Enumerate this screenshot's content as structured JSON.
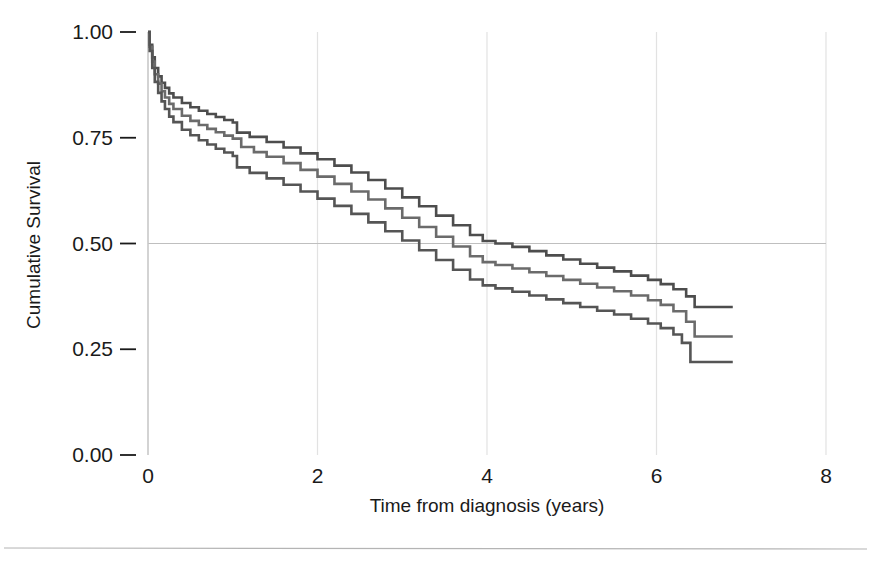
{
  "chart_data": {
    "type": "line",
    "title": "",
    "subtitle": "",
    "xlabel": "Time from diagnosis (years)",
    "ylabel": "Cumulative Survival",
    "xlim": [
      0,
      8
    ],
    "ylim": [
      0,
      1
    ],
    "xticks": [
      "0",
      "2",
      "4",
      "6",
      "8"
    ],
    "xtick_values": [
      0,
      2,
      4,
      6,
      8
    ],
    "yticks": [
      "0.00",
      "0.25",
      "0.50",
      "0.75",
      "1.00"
    ],
    "ytick_values": [
      0,
      0.25,
      0.5,
      0.75,
      1
    ],
    "grid": "faint vertical gridlines at each x tick; single horizontal gridline at y = 0.50",
    "legend": "none",
    "curve_style": "Kaplan-Meier step function",
    "annotations": [],
    "series": [
      {
        "name": "upper-curve",
        "color": "#4d4d4d",
        "final_value": 0.35,
        "x": [
          0,
          0.02,
          0.05,
          0.08,
          0.12,
          0.16,
          0.2,
          0.25,
          0.3,
          0.4,
          0.5,
          0.6,
          0.7,
          0.8,
          0.9,
          1.0,
          1.05,
          1.2,
          1.4,
          1.6,
          1.8,
          2.0,
          2.2,
          2.4,
          2.6,
          2.8,
          3.0,
          3.2,
          3.4,
          3.6,
          3.8,
          3.95,
          4.1,
          4.3,
          4.5,
          4.7,
          4.9,
          5.1,
          5.3,
          5.5,
          5.7,
          5.9,
          6.05,
          6.2,
          6.35,
          6.45,
          6.9
        ],
        "y": [
          1.0,
          0.97,
          0.94,
          0.915,
          0.895,
          0.88,
          0.868,
          0.855,
          0.845,
          0.832,
          0.822,
          0.814,
          0.806,
          0.799,
          0.792,
          0.786,
          0.762,
          0.752,
          0.74,
          0.727,
          0.713,
          0.699,
          0.684,
          0.668,
          0.65,
          0.63,
          0.609,
          0.588,
          0.566,
          0.543,
          0.52,
          0.506,
          0.5,
          0.492,
          0.482,
          0.472,
          0.462,
          0.452,
          0.443,
          0.434,
          0.424,
          0.414,
          0.404,
          0.392,
          0.375,
          0.35,
          0.35
        ]
      },
      {
        "name": "middle-curve",
        "color": "#6b6b6b",
        "final_value": 0.28,
        "x": [
          0,
          0.02,
          0.05,
          0.08,
          0.12,
          0.16,
          0.2,
          0.25,
          0.3,
          0.4,
          0.5,
          0.6,
          0.7,
          0.8,
          0.9,
          1.0,
          1.1,
          1.25,
          1.4,
          1.6,
          1.8,
          2.0,
          2.2,
          2.4,
          2.6,
          2.8,
          3.0,
          3.2,
          3.4,
          3.6,
          3.8,
          3.95,
          4.1,
          4.3,
          4.5,
          4.7,
          4.9,
          5.1,
          5.3,
          5.5,
          5.7,
          5.9,
          6.05,
          6.2,
          6.35,
          6.45,
          6.9
        ],
        "y": [
          1.0,
          0.965,
          0.93,
          0.9,
          0.878,
          0.86,
          0.845,
          0.83,
          0.818,
          0.802,
          0.79,
          0.78,
          0.771,
          0.763,
          0.755,
          0.748,
          0.728,
          0.716,
          0.705,
          0.69,
          0.674,
          0.658,
          0.641,
          0.623,
          0.604,
          0.583,
          0.561,
          0.539,
          0.516,
          0.493,
          0.47,
          0.456,
          0.449,
          0.441,
          0.432,
          0.423,
          0.414,
          0.405,
          0.396,
          0.387,
          0.377,
          0.366,
          0.355,
          0.34,
          0.315,
          0.28,
          0.28
        ]
      },
      {
        "name": "lower-curve",
        "color": "#555555",
        "final_value": 0.22,
        "x": [
          0,
          0.02,
          0.05,
          0.08,
          0.12,
          0.16,
          0.2,
          0.25,
          0.3,
          0.4,
          0.5,
          0.6,
          0.7,
          0.8,
          0.9,
          1.0,
          1.05,
          1.2,
          1.4,
          1.6,
          1.8,
          2.0,
          2.2,
          2.4,
          2.6,
          2.8,
          3.0,
          3.2,
          3.4,
          3.6,
          3.8,
          3.95,
          4.1,
          4.3,
          4.5,
          4.7,
          4.9,
          5.1,
          5.3,
          5.5,
          5.7,
          5.9,
          6.05,
          6.2,
          6.3,
          6.4,
          6.9
        ],
        "y": [
          1.0,
          0.955,
          0.915,
          0.882,
          0.856,
          0.836,
          0.818,
          0.8,
          0.787,
          0.769,
          0.756,
          0.744,
          0.734,
          0.724,
          0.715,
          0.707,
          0.68,
          0.667,
          0.654,
          0.639,
          0.623,
          0.606,
          0.589,
          0.57,
          0.55,
          0.529,
          0.507,
          0.484,
          0.461,
          0.438,
          0.415,
          0.401,
          0.394,
          0.386,
          0.377,
          0.368,
          0.359,
          0.35,
          0.341,
          0.332,
          0.322,
          0.311,
          0.3,
          0.285,
          0.265,
          0.22,
          0.22
        ]
      }
    ]
  },
  "figure": {
    "border_color": "#b4b4b4",
    "background": "#ffffff",
    "gridline_color": "#e2e2e2",
    "axis_color": "#c8c8c8"
  }
}
